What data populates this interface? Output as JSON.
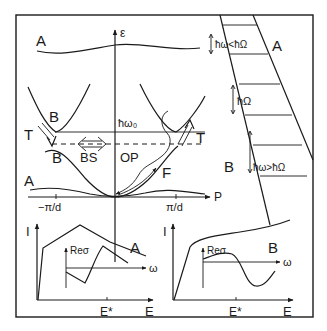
{
  "figure": {
    "frame_color": "#1a1a1a",
    "background": "#ffffff"
  },
  "dispersion_panel": {
    "y_axis_label": "ε",
    "x_axis_label": "P",
    "tick_left": "−π/d",
    "tick_right": "π/d",
    "level_label": "ħω₀",
    "label_A_top": "A",
    "label_A_bottom": "A",
    "label_B_upper": "B",
    "label_B_lower": "B",
    "label_T_left": "T",
    "label_T_right": "T",
    "label_BS": "BS",
    "label_OP": "OP",
    "label_F": "F"
  },
  "ladder_panel": {
    "label_A": "A",
    "label_B": "B",
    "gap_top": "ħω<ħΩ",
    "gap_mid": "ħΩ",
    "gap_bottom": "ħω>ħΩ"
  },
  "iv_panel_A": {
    "y_axis_label": "I",
    "x_axis_label": "E",
    "tick_label": "E*",
    "curve_label": "A",
    "inset_y_label": "Reσ",
    "inset_x_label": "ω"
  },
  "iv_panel_B": {
    "y_axis_label": "I",
    "x_axis_label": "E",
    "tick_label": "E*",
    "curve_label": "B",
    "inset_y_label": "Reσ",
    "inset_x_label": "ω"
  }
}
